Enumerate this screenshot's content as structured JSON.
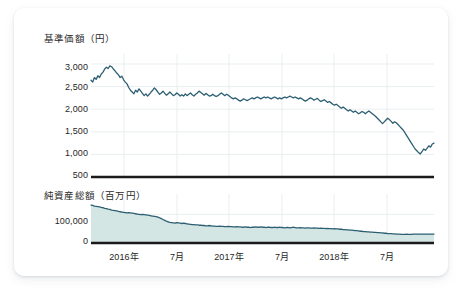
{
  "card": {
    "background": "#ffffff",
    "border_radius": 10
  },
  "colors": {
    "line": "#2d5f73",
    "area_fill": "#d3e6e4",
    "area_line": "#2d5f73",
    "gridline": "#e9eef0",
    "axis": "#1a1a1a",
    "text": "#1f1f1f"
  },
  "chart_data": [
    {
      "type": "line",
      "id": "nav-chart",
      "title": "基準価額（円）",
      "xlabel": "",
      "ylabel": "基準価額（円）",
      "unit": "円",
      "grid": true,
      "legend": "none",
      "ylim": [
        500,
        3000
      ],
      "yticks": [
        3000,
        2500,
        2000,
        1500,
        1000,
        500
      ],
      "ytick_labels": [
        "3,000",
        "2,500",
        "2,000",
        "1,500",
        "1,000",
        "500"
      ],
      "xticks": [
        "2016年",
        "7月",
        "2017年",
        "7月",
        "2018年",
        "7月"
      ],
      "xlim": [
        "2015-12",
        "2019-02"
      ],
      "series": [
        {
          "name": "基準価額",
          "values": [
            2640,
            2600,
            2700,
            2660,
            2740,
            2700,
            2780,
            2820,
            2890,
            2930,
            2900,
            2960,
            2940,
            2890,
            2850,
            2800,
            2760,
            2700,
            2730,
            2650,
            2600,
            2560,
            2480,
            2420,
            2380,
            2340,
            2420,
            2380,
            2450,
            2400,
            2350,
            2300,
            2340,
            2290,
            2330,
            2380,
            2420,
            2470,
            2430,
            2380,
            2330,
            2360,
            2400,
            2350,
            2310,
            2340,
            2380,
            2340,
            2300,
            2320,
            2360,
            2330,
            2290,
            2320,
            2290,
            2340,
            2300,
            2330,
            2360,
            2320,
            2290,
            2330,
            2360,
            2400,
            2370,
            2340,
            2310,
            2350,
            2320,
            2290,
            2300,
            2330,
            2300,
            2280,
            2300,
            2330,
            2360,
            2330,
            2300,
            2330,
            2310,
            2280,
            2250,
            2230,
            2250,
            2230,
            2200,
            2180,
            2200,
            2230,
            2210,
            2190,
            2210,
            2230,
            2250,
            2230,
            2250,
            2270,
            2250,
            2230,
            2250,
            2270,
            2250,
            2270,
            2250,
            2230,
            2250,
            2270,
            2250,
            2230,
            2250,
            2230,
            2250,
            2270,
            2250,
            2270,
            2290,
            2270,
            2250,
            2270,
            2250,
            2230,
            2250,
            2230,
            2200,
            2180,
            2200,
            2230,
            2250,
            2230,
            2200,
            2220,
            2240,
            2200,
            2170,
            2190,
            2210,
            2180,
            2150,
            2170,
            2140,
            2110,
            2090,
            2110,
            2080,
            2050,
            2020,
            2050,
            2020,
            1990,
            1960,
            1990,
            1960,
            1930,
            1960,
            1930,
            1900,
            1920,
            1950,
            1930,
            1900,
            1930,
            1960,
            1930,
            1900,
            1870,
            1840,
            1800,
            1760,
            1720,
            1680,
            1720,
            1760,
            1800,
            1770,
            1730,
            1690,
            1720,
            1700,
            1660,
            1620,
            1580,
            1540,
            1480,
            1420,
            1360,
            1300,
            1240,
            1180,
            1120,
            1080,
            1040,
            1010,
            1060,
            1120,
            1090,
            1140,
            1190,
            1160,
            1230,
            1250
          ]
        }
      ]
    },
    {
      "type": "area",
      "id": "aum-chart",
      "title": "純資産総額（百万円）",
      "xlabel": "",
      "ylabel": "純資産総額（百万円）",
      "unit": "百万円",
      "grid": true,
      "legend": "none",
      "ylim": [
        0,
        150000
      ],
      "yticks": [
        100000,
        0
      ],
      "ytick_labels": [
        "100,000",
        "0"
      ],
      "xticks": [
        "2016年",
        "7月",
        "2017年",
        "7月",
        "2018年",
        "7月"
      ],
      "series": [
        {
          "name": "純資産総額",
          "values": [
            132000,
            131000,
            129000,
            128000,
            127000,
            126000,
            124000,
            123000,
            121000,
            120000,
            118000,
            117000,
            115000,
            114000,
            113000,
            112000,
            110000,
            109000,
            108000,
            107000,
            106000,
            105000,
            106000,
            105000,
            104000,
            103000,
            102000,
            101000,
            100000,
            99000,
            100000,
            99000,
            98000,
            97000,
            96000,
            95000,
            94000,
            93000,
            92000,
            90000,
            88000,
            85000,
            82000,
            79000,
            76000,
            74000,
            72000,
            71000,
            70000,
            69000,
            71000,
            70000,
            69000,
            68000,
            69000,
            68000,
            67000,
            66000,
            65000,
            64000,
            64000,
            63000,
            63000,
            62000,
            62000,
            61000,
            61000,
            60000,
            60000,
            61000,
            60000,
            59000,
            59000,
            58000,
            58000,
            59000,
            58000,
            58000,
            57000,
            57000,
            58000,
            57000,
            57000,
            56000,
            56000,
            57000,
            56000,
            56000,
            55000,
            55000,
            56000,
            55000,
            55000,
            54000,
            55000,
            55000,
            56000,
            55000,
            55000,
            56000,
            55000,
            55000,
            54000,
            55000,
            55000,
            54000,
            54000,
            55000,
            54000,
            54000,
            55000,
            54000,
            54000,
            53000,
            54000,
            54000,
            53000,
            54000,
            55000,
            54000,
            53000,
            53000,
            54000,
            53000,
            53000,
            52000,
            53000,
            53000,
            52000,
            52000,
            53000,
            52000,
            52000,
            51000,
            52000,
            51000,
            51000,
            50000,
            51000,
            50000,
            50000,
            49000,
            50000,
            49000,
            49000,
            48000,
            48000,
            47000,
            47000,
            46000,
            46000,
            45000,
            45000,
            44000,
            43000,
            43000,
            42000,
            41000,
            41000,
            40000,
            40000,
            39000,
            39000,
            38000,
            38000,
            37000,
            37000,
            36000,
            36000,
            35000,
            35000,
            34000,
            34000,
            33000,
            33000,
            33000,
            32000,
            32000,
            31000,
            31000,
            31000,
            30000,
            30000,
            30000,
            31000,
            30000,
            30000,
            30000,
            31000,
            31000,
            31000,
            31000,
            31000,
            31000,
            31000,
            31000,
            31000,
            31000,
            31000,
            31000,
            31000
          ]
        }
      ]
    }
  ]
}
